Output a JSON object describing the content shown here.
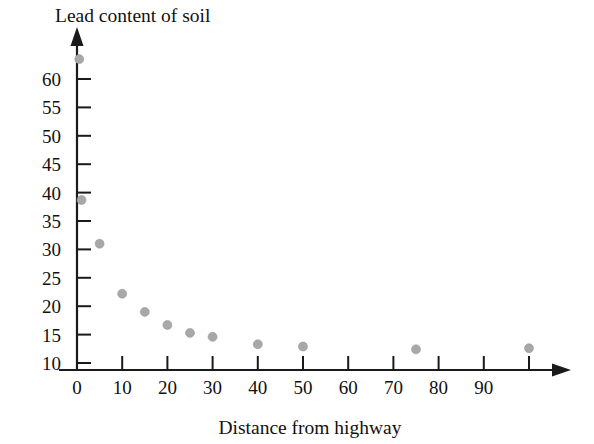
{
  "chart_data": {
    "type": "scatter",
    "title": "Lead content of soil",
    "xlabel": "Distance from highway",
    "ylabel": "Lead content of soil",
    "grid": false,
    "legend": null,
    "xlim": [
      0,
      104
    ],
    "ylim": [
      8.8,
      66
    ],
    "x_ticks": [
      0,
      10,
      20,
      30,
      40,
      50,
      60,
      70,
      80,
      90,
      100
    ],
    "x_tick_labels": [
      "0",
      "10",
      "20",
      "30",
      "40",
      "50",
      "60",
      "70",
      "80",
      "90",
      ""
    ],
    "y_ticks": [
      10,
      15,
      20,
      25,
      30,
      35,
      40,
      45,
      50,
      55,
      60
    ],
    "y_tick_labels": [
      "10",
      "15",
      "20",
      "25",
      "30",
      "35",
      "40",
      "45",
      "50",
      "55",
      "60"
    ],
    "x": [
      0.5,
      1,
      5,
      10,
      15,
      20,
      25,
      30,
      40,
      50,
      75,
      100
    ],
    "y": [
      63.5,
      38.7,
      31,
      22.2,
      19,
      16.7,
      15.3,
      14.6,
      13.3,
      12.9,
      12.4,
      12.6
    ],
    "points": [
      {
        "x": 0.5,
        "y": 63.5
      },
      {
        "x": 1,
        "y": 38.7
      },
      {
        "x": 5,
        "y": 31
      },
      {
        "x": 10,
        "y": 22.2
      },
      {
        "x": 15,
        "y": 19
      },
      {
        "x": 20,
        "y": 16.7
      },
      {
        "x": 25,
        "y": 15.3
      },
      {
        "x": 30,
        "y": 14.6
      },
      {
        "x": 40,
        "y": 13.3
      },
      {
        "x": 50,
        "y": 12.9
      },
      {
        "x": 75,
        "y": 12.4
      },
      {
        "x": 100,
        "y": 12.6
      }
    ],
    "marker": {
      "shape": "circle",
      "color": "#a8a8a8",
      "size": 9
    },
    "axis_color": "#1a1a1a",
    "background_color": "#ffffff"
  }
}
